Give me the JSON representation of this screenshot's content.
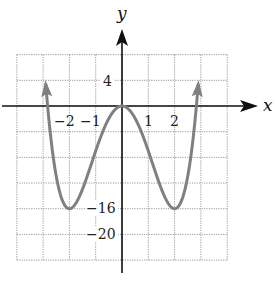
{
  "chart_data": {
    "type": "line",
    "title": "",
    "xlabel": "x",
    "ylabel": "y",
    "function": "y = x^4 - 8x^2",
    "xlim": [
      -4,
      4
    ],
    "ylim": [
      -24,
      8
    ],
    "grid": true,
    "x_grid_step": 1,
    "y_grid_step": 4,
    "x_tick_labels": [
      "-2",
      "-1",
      "1",
      "2"
    ],
    "x_tick_values": [
      -2,
      -1,
      1,
      2
    ],
    "y_tick_labels": [
      "4",
      "-16",
      "-20"
    ],
    "y_tick_values": [
      4,
      -16,
      -20
    ],
    "series": [
      {
        "name": "curve",
        "x": [
          -2.97,
          -2.5,
          -2,
          -1.5,
          -1,
          -0.5,
          0,
          0.5,
          1,
          1.5,
          2,
          2.5,
          2.97
        ],
        "y": [
          8,
          -11.0,
          -16,
          -12.9,
          -7,
          -1.9,
          0,
          -1.9,
          -7,
          -12.9,
          -16,
          -11.0,
          8
        ],
        "end_arrows": true
      }
    ],
    "key_points": [
      {
        "label": "local max",
        "x": 0,
        "y": 0
      },
      {
        "label": "local min",
        "x": -2,
        "y": -16
      },
      {
        "label": "local min",
        "x": 2,
        "y": -16
      }
    ]
  },
  "labels": {
    "x_axis": "x",
    "y_axis": "y",
    "xticks": [
      "−2",
      "−1",
      "1",
      "2"
    ],
    "yticks": [
      "4",
      "−16",
      "−20"
    ]
  },
  "colors": {
    "curve": "#808080",
    "axis": "#111111",
    "grid": "#9a9a9a"
  }
}
